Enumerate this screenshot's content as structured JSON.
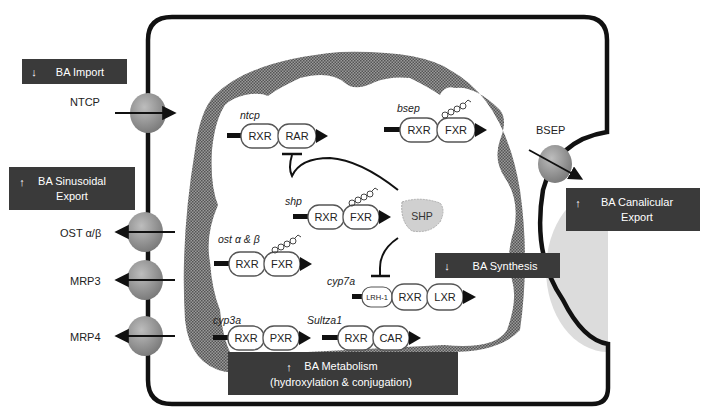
{
  "colors": {
    "box_bg": "#3a3a3a",
    "box_text": "#ffffff",
    "nucleus_fill": "#7a7a7a",
    "membrane": "#111111",
    "transporter": "#9a9a9a",
    "canaliculus": "#dddddd",
    "shp_fill": "#d0d0d0",
    "receptor_stroke": "#555555"
  },
  "boxes": {
    "ba_import": {
      "arrow": "down",
      "line1": "BA Import"
    },
    "ba_sinusoidal_export": {
      "arrow": "up",
      "line1": "BA Sinusoidal",
      "line2": "Export"
    },
    "ba_canalicular_export": {
      "arrow": "up",
      "line1": "BA Canalicular",
      "line2": "Export"
    },
    "ba_synthesis": {
      "arrow": "down",
      "line1": "BA Synthesis"
    },
    "ba_metabolism": {
      "arrow": "up",
      "line1": "BA Metabolism",
      "line2": "(hydroxylation & conjugation)"
    }
  },
  "transporters": {
    "ntcp": "NTCP",
    "ost": "OST α/β",
    "mrp3": "MRP3",
    "mrp4": "MRP4",
    "bsep": "BSEP"
  },
  "genes": {
    "ntcp": {
      "name": "ntcp",
      "r1": "RXR",
      "r2": "RAR"
    },
    "bsep": {
      "name": "bsep",
      "r1": "RXR",
      "r2": "FXR"
    },
    "shp": {
      "name": "shp",
      "r1": "RXR",
      "r2": "FXR"
    },
    "ost": {
      "name": "ost α & β",
      "r1": "RXR",
      "r2": "FXR"
    },
    "cyp7a": {
      "name": "cyp7a",
      "r0": "LRH-1",
      "r1": "RXR",
      "r2": "LXR"
    },
    "cyp3a": {
      "name": "cyp3a",
      "r1": "RXR",
      "r2": "PXR"
    },
    "sultza1": {
      "name": "Sultza1",
      "r1": "RXR",
      "r2": "CAR"
    }
  },
  "shp_protein": "SHP"
}
